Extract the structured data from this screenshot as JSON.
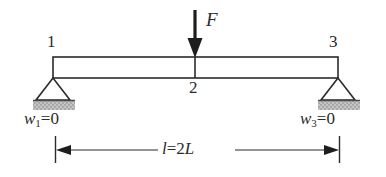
{
  "diagram": {
    "colors": {
      "line": "#2b2b2b",
      "ground_fill": "#b9b9b9",
      "ground_edge": "#4a4a4a",
      "background": "#ffffff"
    },
    "beam": {
      "left_x": 53,
      "right_x": 338,
      "top_y": 57,
      "bottom_y": 78
    },
    "nodes": [
      {
        "id": "node-1",
        "label": "1",
        "x": 53,
        "position": "left-end",
        "label_x": 47,
        "label_y": 36
      },
      {
        "id": "node-2",
        "label": "2",
        "x": 195,
        "position": "midspan",
        "label_x": 189,
        "label_y": 81
      },
      {
        "id": "node-3",
        "label": "3",
        "x": 338,
        "position": "right-end",
        "label_x": 329,
        "label_y": 36
      }
    ],
    "load": {
      "label": "F",
      "direction": "down",
      "arrow_x": 195,
      "arrow_top_y": 10,
      "arrow_tip_y": 57,
      "label_x": 206,
      "label_y": 11
    },
    "supports": [
      {
        "id": "support-left",
        "type": "pin",
        "apex_x": 53,
        "apex_y": 78,
        "base_y": 100,
        "half_width": 17,
        "ground": {
          "x": 33,
          "y": 100,
          "width": 42,
          "height": 10
        }
      },
      {
        "id": "support-right",
        "type": "pin",
        "apex_x": 338,
        "apex_y": 78,
        "base_y": 100,
        "half_width": 17,
        "ground": {
          "x": 318,
          "y": 100,
          "width": 42,
          "height": 10
        }
      }
    ],
    "boundary_conditions": [
      {
        "id": "bc-left",
        "symbol": "w",
        "subscript": "1",
        "equals": "=0",
        "x": 24,
        "y": 111
      },
      {
        "id": "bc-right",
        "symbol": "w",
        "subscript": "3",
        "equals": "=0",
        "x": 300,
        "y": 111
      }
    ],
    "dimension": {
      "id": "span-dimension",
      "label_symbol": "l",
      "label_rest": "=2",
      "label_symbol2": "L",
      "y": 150,
      "left_x": 55,
      "right_x": 340,
      "tick_top_y": 136,
      "tick_bottom_y": 163,
      "label_x": 160,
      "label_y": 141
    }
  }
}
